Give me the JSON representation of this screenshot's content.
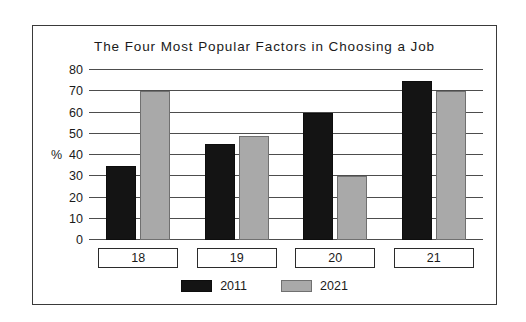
{
  "figure": {
    "border_color": "#3a3a3a",
    "background": "#ffffff"
  },
  "chart_data": {
    "type": "bar",
    "title": "The Four Most Popular Factors in Choosing a Job",
    "xlabel": "",
    "ylabel": "%",
    "ylim": [
      0,
      80
    ],
    "ytick_step": 10,
    "yticks": [
      80,
      70,
      60,
      50,
      40,
      30,
      20,
      10,
      0
    ],
    "grid": true,
    "grid_axis": "y",
    "legend_position": "bottom-center",
    "categories": [
      "18",
      "19",
      "20",
      "21"
    ],
    "series": [
      {
        "name": "2011",
        "color": "#141414",
        "values": [
          35,
          45,
          60,
          75
        ]
      },
      {
        "name": "2021",
        "color": "#a9a9a9",
        "values": [
          70,
          49,
          30,
          70
        ]
      }
    ]
  }
}
